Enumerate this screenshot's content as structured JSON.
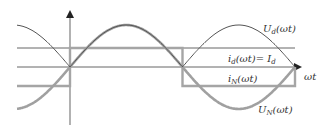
{
  "diagram": {
    "title": "",
    "axes": {
      "x_label": "ωt",
      "y_label": ""
    },
    "curves": [
      {
        "id": "Ud",
        "label_main": "U",
        "label_sub": "d",
        "label_rest": "(ωt)",
        "description": "rectified DC-side voltage |sin(ωt)|",
        "color": "#555555"
      },
      {
        "id": "id",
        "label_main": "i",
        "label_sub": "d",
        "label_rest": "(ωt)= I",
        "label_sub2": "d",
        "description": "constant DC current",
        "color": "#555555"
      },
      {
        "id": "iN",
        "label_main": "i",
        "label_sub": "N",
        "label_rest": "(ωt)",
        "description": "square-wave line current",
        "color": "#a0a0a0"
      },
      {
        "id": "UN",
        "label_main": "U",
        "label_sub": "N",
        "label_rest": "(ωt)",
        "description": "sinusoidal line voltage sin(ωt)",
        "color": "#9a9a9a"
      }
    ],
    "colors": {
      "axis": "#777777",
      "thin_curve": "#555555",
      "thick_curve": "#a3a3a3",
      "background": "#ffffff"
    }
  }
}
